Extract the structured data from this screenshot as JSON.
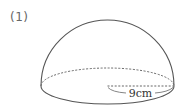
{
  "problem": {
    "number_label": "(1)"
  },
  "figure": {
    "shape": "hemisphere",
    "radius_label": "9cm",
    "stroke_color": "#555555",
    "dash_color": "#666666"
  }
}
